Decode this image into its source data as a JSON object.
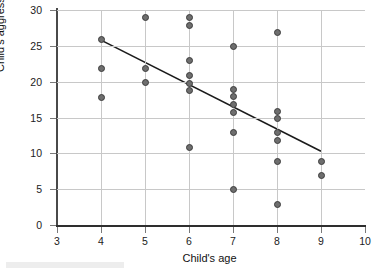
{
  "chart_data": {
    "type": "scatter",
    "title": "",
    "xlabel": "Child's age",
    "ylabel": "Child's aggression score",
    "xlim": [
      3,
      10
    ],
    "ylim": [
      0,
      30
    ],
    "xticks": [
      3,
      4,
      5,
      6,
      7,
      8,
      9,
      10
    ],
    "yticks": [
      0,
      5,
      10,
      15,
      20,
      25,
      30
    ],
    "grid": true,
    "legend": null,
    "points": [
      {
        "x": 4,
        "y": 25.9
      },
      {
        "x": 4,
        "y": 21.9
      },
      {
        "x": 4,
        "y": 17.8
      },
      {
        "x": 5,
        "y": 28.9
      },
      {
        "x": 5,
        "y": 21.9
      },
      {
        "x": 5,
        "y": 19.9
      },
      {
        "x": 6,
        "y": 28.9
      },
      {
        "x": 6,
        "y": 27.8
      },
      {
        "x": 6,
        "y": 22.9
      },
      {
        "x": 6,
        "y": 20.9
      },
      {
        "x": 6,
        "y": 19.7
      },
      {
        "x": 6,
        "y": 18.8
      },
      {
        "x": 6,
        "y": 10.8
      },
      {
        "x": 7,
        "y": 24.9
      },
      {
        "x": 7,
        "y": 18.9
      },
      {
        "x": 7,
        "y": 17.9
      },
      {
        "x": 7,
        "y": 16.8
      },
      {
        "x": 7,
        "y": 15.7
      },
      {
        "x": 7,
        "y": 12.9
      },
      {
        "x": 7,
        "y": 4.9
      },
      {
        "x": 8,
        "y": 26.8
      },
      {
        "x": 8,
        "y": 15.9
      },
      {
        "x": 8,
        "y": 14.8
      },
      {
        "x": 8,
        "y": 12.9
      },
      {
        "x": 8,
        "y": 11.8
      },
      {
        "x": 8,
        "y": 8.9
      },
      {
        "x": 8,
        "y": 2.9
      },
      {
        "x": 9,
        "y": 8.8
      },
      {
        "x": 9,
        "y": 6.9
      }
    ],
    "trendline": {
      "x0": 4,
      "y0": 25.8,
      "x1": 9,
      "y1": 10.3
    }
  },
  "colors": {
    "marker_fill": "#6e6e6e",
    "marker_edge": "#3c3c3c",
    "gridline": "#c8c8c8",
    "axis": "#2e2e2e",
    "trendline": "#1a1a1a",
    "text": "#111111",
    "background": "#ffffff"
  }
}
